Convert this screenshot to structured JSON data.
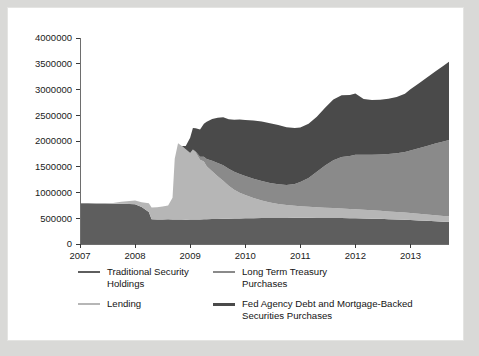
{
  "figure": {
    "background_color": "#d9d9d7",
    "card_color": "#ffffff"
  },
  "chart_data": {
    "type": "area",
    "stacked": true,
    "title": "",
    "subtitle": "",
    "xlabel": "",
    "ylabel": "",
    "xlim": [
      2007.0,
      2013.7
    ],
    "ylim": [
      0,
      4000000
    ],
    "grid": false,
    "legend_position": "below",
    "y_ticks": [
      0,
      500000,
      1000000,
      1500000,
      2000000,
      2500000,
      3000000,
      3500000,
      4000000
    ],
    "y_tick_labels": [
      "0",
      "500000",
      "1000000",
      "1500000",
      "2000000",
      "2500000",
      "3000000",
      "3500000",
      "4000000"
    ],
    "x_ticks": [
      2007,
      2008,
      2009,
      2010,
      2011,
      2012,
      2013
    ],
    "x_tick_labels": [
      "2007",
      "2008",
      "2009",
      "2010",
      "2011",
      "2012",
      "2013"
    ],
    "x": [
      2007.0,
      2007.15,
      2007.3,
      2007.45,
      2007.6,
      2007.75,
      2007.9,
      2008.0,
      2008.12,
      2008.25,
      2008.3,
      2008.4,
      2008.5,
      2008.6,
      2008.68,
      2008.72,
      2008.78,
      2008.85,
      2008.92,
      2009.0,
      2009.05,
      2009.1,
      2009.18,
      2009.25,
      2009.3,
      2009.4,
      2009.5,
      2009.6,
      2009.7,
      2009.8,
      2009.9,
      2010.0,
      2010.15,
      2010.3,
      2010.45,
      2010.6,
      2010.75,
      2010.9,
      2011.0,
      2011.15,
      2011.3,
      2011.45,
      2011.6,
      2011.75,
      2011.9,
      2012.0,
      2012.15,
      2012.3,
      2012.45,
      2012.6,
      2012.75,
      2012.9,
      2013.0,
      2013.15,
      2013.3,
      2013.45,
      2013.6,
      2013.7
    ],
    "series": [
      {
        "name": "Traditional Security Holdings",
        "color": "#5e5e5e",
        "values": [
          790000,
          790000,
          785000,
          785000,
          780000,
          780000,
          775000,
          770000,
          720000,
          620000,
          480000,
          475000,
          478000,
          480000,
          478000,
          476000,
          475000,
          474000,
          472000,
          475000,
          476000,
          477000,
          478000,
          480000,
          482000,
          485000,
          487000,
          490000,
          492000,
          495000,
          497000,
          500000,
          502000,
          504000,
          505000,
          506000,
          507000,
          508000,
          508000,
          508000,
          507000,
          506000,
          505000,
          503000,
          501000,
          499000,
          496000,
          492000,
          488000,
          483000,
          478000,
          472000,
          466000,
          458000,
          450000,
          442000,
          434000,
          430000
        ]
      },
      {
        "name": "Lending",
        "color": "#b6b6b6",
        "values": [
          8000,
          8000,
          10000,
          12000,
          15000,
          40000,
          60000,
          75000,
          90000,
          170000,
          230000,
          240000,
          250000,
          270000,
          420000,
          1180000,
          1480000,
          1430000,
          1370000,
          1290000,
          1350000,
          1300000,
          1160000,
          1120000,
          1030000,
          930000,
          830000,
          740000,
          640000,
          560000,
          500000,
          450000,
          390000,
          340000,
          300000,
          272000,
          250000,
          235000,
          225000,
          215000,
          205000,
          198000,
          192000,
          186000,
          180000,
          175000,
          168000,
          162000,
          156000,
          150000,
          145000,
          140000,
          136000,
          130000,
          124000,
          118000,
          112000,
          108000
        ]
      },
      {
        "name": "Long Term Treasury Purchases",
        "color": "#8a8a8a",
        "values": [
          0,
          0,
          0,
          0,
          0,
          0,
          0,
          0,
          0,
          0,
          0,
          0,
          0,
          0,
          0,
          0,
          0,
          0,
          0,
          0,
          8000,
          20000,
          55000,
          95000,
          140000,
          200000,
          255000,
          300000,
          330000,
          350000,
          360000,
          370000,
          375000,
          378000,
          380000,
          382000,
          390000,
          420000,
          470000,
          560000,
          690000,
          820000,
          930000,
          1000000,
          1030000,
          1060000,
          1070000,
          1080000,
          1095000,
          1115000,
          1140000,
          1175000,
          1215000,
          1270000,
          1330000,
          1390000,
          1445000,
          1480000
        ]
      },
      {
        "name": "Fed Agency Debt and Mortgage-Backed Securities Purchases",
        "color": "#4a4a4a",
        "values": [
          0,
          0,
          0,
          0,
          0,
          0,
          0,
          0,
          0,
          0,
          0,
          0,
          0,
          0,
          0,
          0,
          0,
          0,
          60000,
          300000,
          420000,
          450000,
          530000,
          640000,
          720000,
          810000,
          880000,
          930000,
          960000,
          1010000,
          1060000,
          1090000,
          1130000,
          1155000,
          1160000,
          1150000,
          1120000,
          1090000,
          1060000,
          1050000,
          1070000,
          1120000,
          1180000,
          1200000,
          1180000,
          1190000,
          1080000,
          1060000,
          1060000,
          1070000,
          1090000,
          1130000,
          1190000,
          1260000,
          1330000,
          1400000,
          1470000,
          1520000
        ]
      }
    ]
  },
  "legend": {
    "entries": [
      {
        "label": "Traditional Security\nHoldings",
        "color": "#5e5e5e",
        "thick": false
      },
      {
        "label": "Long Term Treasury\nPurchases",
        "color": "#8a8a8a",
        "thick": false
      },
      {
        "label": "Lending",
        "color": "#b6b6b6",
        "thick": false
      },
      {
        "label": "Fed Agency Debt and Mortgage-Backed\nSecurities Purchases",
        "color": "#4a4a4a",
        "thick": true
      }
    ]
  }
}
